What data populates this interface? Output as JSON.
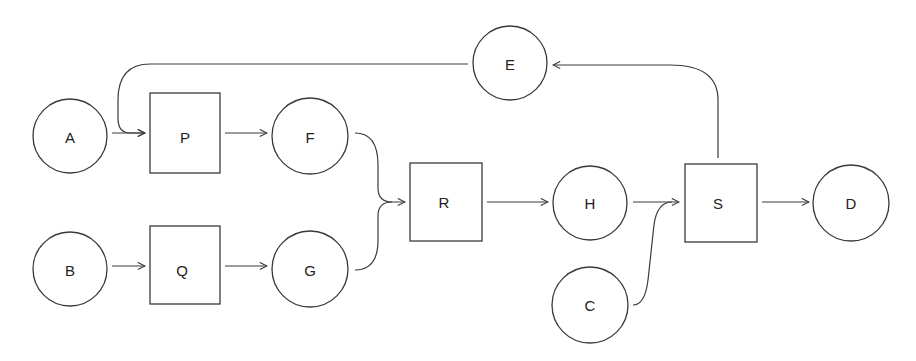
{
  "diagram": {
    "type": "flow-network",
    "nodes": [
      {
        "id": "A",
        "label": "A",
        "shape": "circle",
        "cx": 70,
        "cy": 136,
        "r": 37
      },
      {
        "id": "P",
        "label": "P",
        "shape": "rect",
        "x": 150,
        "y": 93,
        "w": 70,
        "h": 80
      },
      {
        "id": "F",
        "label": "F",
        "shape": "circle",
        "cx": 310,
        "cy": 136,
        "r": 38
      },
      {
        "id": "E",
        "label": "E",
        "shape": "circle",
        "cx": 510,
        "cy": 63,
        "r": 37
      },
      {
        "id": "B",
        "label": "B",
        "shape": "circle",
        "cx": 70,
        "cy": 269,
        "r": 37
      },
      {
        "id": "Q",
        "label": "Q",
        "shape": "rect",
        "x": 150,
        "y": 226,
        "w": 70,
        "h": 78
      },
      {
        "id": "G",
        "label": "G",
        "shape": "circle",
        "cx": 310,
        "cy": 269,
        "r": 38
      },
      {
        "id": "R",
        "label": "R",
        "shape": "rect",
        "x": 410,
        "y": 163,
        "w": 72,
        "h": 78
      },
      {
        "id": "H",
        "label": "H",
        "shape": "circle",
        "cx": 590,
        "cy": 203,
        "r": 37
      },
      {
        "id": "S",
        "label": "S",
        "shape": "rect",
        "x": 685,
        "y": 164,
        "w": 72,
        "h": 78
      },
      {
        "id": "D",
        "label": "D",
        "shape": "circle",
        "cx": 851,
        "cy": 203,
        "r": 38
      },
      {
        "id": "C",
        "label": "C",
        "shape": "circle",
        "cx": 590,
        "cy": 305,
        "r": 38
      }
    ],
    "edges": [
      {
        "from": "A",
        "to": "P"
      },
      {
        "from": "E",
        "to": "P"
      },
      {
        "from": "P",
        "to": "F"
      },
      {
        "from": "B",
        "to": "Q"
      },
      {
        "from": "Q",
        "to": "G"
      },
      {
        "from": "F",
        "to": "R"
      },
      {
        "from": "G",
        "to": "R"
      },
      {
        "from": "R",
        "to": "H"
      },
      {
        "from": "H",
        "to": "S"
      },
      {
        "from": "C",
        "to": "S"
      },
      {
        "from": "S",
        "to": "D"
      },
      {
        "from": "S",
        "to": "E"
      }
    ]
  }
}
